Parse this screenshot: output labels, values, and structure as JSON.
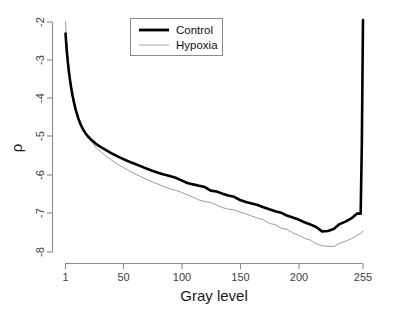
{
  "chart_data": {
    "type": "line",
    "title": "",
    "subtitle": "",
    "xlabel": "Gray level",
    "ylabel": "ρ",
    "xlim": [
      1,
      255
    ],
    "ylim": [
      -8,
      -2
    ],
    "grid": false,
    "legend_position": "top-center",
    "xticks": [
      1,
      50,
      100,
      150,
      200,
      255
    ],
    "xticklabels": [
      "1",
      "50",
      "100",
      "150",
      "200",
      "255"
    ],
    "yticks": [
      -2,
      -3,
      -4,
      -5,
      -6,
      -7,
      -8
    ],
    "yticklabels": [
      "-2",
      "-3",
      "-4",
      "-5",
      "-6",
      "-7",
      "-8"
    ],
    "series": [
      {
        "name": "Control",
        "color": "#000000",
        "linewidth": 2.6,
        "x": [
          1,
          2,
          3,
          4,
          5,
          6,
          7,
          8,
          9,
          10,
          12,
          14,
          16,
          18,
          20,
          24,
          28,
          32,
          36,
          40,
          45,
          50,
          55,
          60,
          65,
          70,
          75,
          80,
          85,
          90,
          95,
          100,
          105,
          110,
          115,
          120,
          125,
          130,
          135,
          140,
          145,
          150,
          155,
          160,
          165,
          170,
          175,
          180,
          185,
          190,
          195,
          200,
          205,
          210,
          215,
          220,
          225,
          230,
          235,
          240,
          245,
          250,
          253,
          254,
          255
        ],
        "y": [
          -2.3,
          -2.72,
          -3.05,
          -3.32,
          -3.55,
          -3.75,
          -3.92,
          -4.07,
          -4.2,
          -4.32,
          -4.52,
          -4.68,
          -4.8,
          -4.9,
          -4.98,
          -5.1,
          -5.2,
          -5.28,
          -5.35,
          -5.42,
          -5.5,
          -5.57,
          -5.64,
          -5.7,
          -5.76,
          -5.82,
          -5.88,
          -5.93,
          -5.98,
          -6.03,
          -6.08,
          -6.13,
          -6.18,
          -6.23,
          -6.28,
          -6.33,
          -6.38,
          -6.43,
          -6.47,
          -6.52,
          -6.57,
          -6.62,
          -6.67,
          -6.72,
          -6.77,
          -6.82,
          -6.88,
          -6.93,
          -6.98,
          -7.04,
          -7.1,
          -7.16,
          -7.23,
          -7.3,
          -7.36,
          -7.44,
          -7.46,
          -7.4,
          -7.3,
          -7.2,
          -7.1,
          -7.02,
          -7.0,
          -5.2,
          -1.95
        ],
        "note": "Thick black curve; noisy jitter in mid-to-right range; minimum about -7.5 near gray level 220; sharp vertical rise at 255"
      },
      {
        "name": "Hypoxia",
        "color": "#9a9a9a",
        "linewidth": 1.0,
        "x": [
          1,
          2,
          3,
          4,
          5,
          6,
          7,
          8,
          9,
          10,
          12,
          14,
          16,
          18,
          20,
          24,
          28,
          32,
          36,
          40,
          45,
          50,
          55,
          60,
          65,
          70,
          75,
          80,
          85,
          90,
          95,
          100,
          105,
          110,
          115,
          120,
          125,
          130,
          135,
          140,
          145,
          150,
          155,
          160,
          165,
          170,
          175,
          180,
          185,
          190,
          195,
          200,
          205,
          210,
          215,
          220,
          225,
          230,
          235,
          240,
          245,
          250,
          253,
          255
        ],
        "y": [
          -1.98,
          -2.52,
          -2.9,
          -3.2,
          -3.45,
          -3.66,
          -3.84,
          -4.0,
          -4.14,
          -4.27,
          -4.48,
          -4.65,
          -4.79,
          -4.9,
          -5.0,
          -5.16,
          -5.3,
          -5.41,
          -5.51,
          -5.6,
          -5.7,
          -5.79,
          -5.88,
          -5.96,
          -6.03,
          -6.1,
          -6.17,
          -6.23,
          -6.29,
          -6.35,
          -6.41,
          -6.47,
          -6.52,
          -6.58,
          -6.63,
          -6.68,
          -6.73,
          -6.78,
          -6.83,
          -6.88,
          -6.93,
          -6.98,
          -7.03,
          -7.08,
          -7.13,
          -7.18,
          -7.24,
          -7.3,
          -7.36,
          -7.42,
          -7.49,
          -7.56,
          -7.63,
          -7.7,
          -7.76,
          -7.82,
          -7.85,
          -7.84,
          -7.8,
          -7.74,
          -7.66,
          -7.58,
          -7.52,
          -7.45
        ],
        "note": "Thin gray curve; starts above the top of the axis range; lies below Control from about gray level 15 onward; minimum about -7.85 near gray level 225"
      }
    ]
  },
  "legend": {
    "entries": [
      {
        "label": "Control",
        "style": "thick-black-line"
      },
      {
        "label": "Hypoxia",
        "style": "thin-gray-line"
      }
    ]
  },
  "axes": {
    "x_title": "Gray level",
    "y_title": "ρ"
  },
  "colors": {
    "control": "#000000",
    "hypoxia": "#9a9a9a",
    "axis": "#8a8a8a",
    "tick_text": "#3d3d3d",
    "title_text": "#1a1a1a",
    "background": "#ffffff"
  }
}
